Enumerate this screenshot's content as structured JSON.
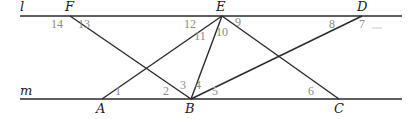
{
  "diagram": {
    "lines": [
      {
        "name": "l",
        "label": "l",
        "x1": 20,
        "y1": 16,
        "x2": 402,
        "y2": 16,
        "label_pos": [
          20,
          11
        ]
      },
      {
        "name": "m",
        "label": "m",
        "x1": 20,
        "y1": 99,
        "x2": 402,
        "y2": 99,
        "label_pos": [
          20,
          95
        ]
      }
    ],
    "points": [
      {
        "label": "F",
        "x": 70,
        "y": 16,
        "label_pos": [
          65,
          11
        ]
      },
      {
        "label": "E",
        "x": 222,
        "y": 16,
        "label_pos": [
          216,
          11
        ]
      },
      {
        "label": "D",
        "x": 362,
        "y": 16,
        "label_pos": [
          357,
          11
        ]
      },
      {
        "label": "A",
        "x": 102,
        "y": 99,
        "label_pos": [
          96,
          113
        ]
      },
      {
        "label": "B",
        "x": 191,
        "y": 99,
        "label_pos": [
          185,
          113
        ]
      },
      {
        "label": "C",
        "x": 339,
        "y": 99,
        "label_pos": [
          334,
          113
        ]
      }
    ],
    "segments": [
      {
        "from": "F",
        "to": "B",
        "x1": 70,
        "y1": 16,
        "x2": 191,
        "y2": 99
      },
      {
        "from": "E",
        "to": "A",
        "x1": 222,
        "y1": 16,
        "x2": 102,
        "y2": 99
      },
      {
        "from": "E",
        "to": "B",
        "x1": 222,
        "y1": 16,
        "x2": 191,
        "y2": 99
      },
      {
        "from": "E",
        "to": "C",
        "x1": 222,
        "y1": 16,
        "x2": 339,
        "y2": 99
      },
      {
        "from": "D",
        "to": "B",
        "x1": 362,
        "y1": 16,
        "x2": 191,
        "y2": 99
      }
    ],
    "angles": [
      {
        "label": "1",
        "x": 118,
        "y": 95
      },
      {
        "label": "2",
        "x": 166,
        "y": 95
      },
      {
        "label": "3",
        "x": 183,
        "y": 89
      },
      {
        "label": "4",
        "x": 198,
        "y": 89
      },
      {
        "label": "5",
        "x": 215,
        "y": 95
      },
      {
        "label": "6",
        "x": 311,
        "y": 95
      },
      {
        "label": "7",
        "x": 362,
        "y": 28
      },
      {
        "label": "8",
        "x": 332,
        "y": 28
      },
      {
        "label": "9",
        "x": 238,
        "y": 26
      },
      {
        "label": "10",
        "x": 222,
        "y": 36
      },
      {
        "label": "11",
        "x": 200,
        "y": 40
      },
      {
        "label": "12",
        "x": 190,
        "y": 28
      },
      {
        "label": "13",
        "x": 84,
        "y": 28
      },
      {
        "label": "14",
        "x": 57,
        "y": 28
      }
    ]
  }
}
